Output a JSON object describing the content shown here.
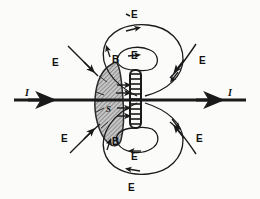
{
  "figure": {
    "type": "physics-field-diagram",
    "background_color": "#fbfbfa",
    "ink_color": "#1a1a1a",
    "shaded_region_fill": "#b9b9b9"
  },
  "labels": {
    "current_left": "I",
    "current_right": "I",
    "surface": "S",
    "b_top": "B",
    "b_bottom": "B",
    "e_top_outer": "E",
    "e_top_inner": "E",
    "e_left_upper": "E",
    "e_right_upper": "E",
    "e_left_lower": "E",
    "e_right_lower": "E",
    "e_bottom_inner": "E",
    "e_bottom_outer": "E"
  },
  "elements": {
    "conductor_wire": "horizontal-current-wire",
    "central_rod": "hatched-vertical-rod",
    "surface_patch": "shaded-surface-s",
    "field_loops": [
      "inner-top-loop",
      "inner-bottom-loop",
      "outer-top-loop",
      "outer-bottom-loop",
      "open-arc-top-left",
      "open-arc-top-right",
      "open-arc-bottom-left",
      "open-arc-bottom-right"
    ]
  }
}
